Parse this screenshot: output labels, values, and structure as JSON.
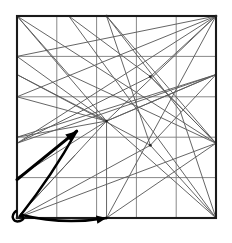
{
  "figure": {
    "background_color": "#ffffff",
    "caption": "",
    "width": 232,
    "height": 243
  },
  "colors": {
    "border": "#1a1a1a",
    "grid": "#7a7a7a",
    "ray": "#5d5d5d",
    "arrow": "#000000",
    "background": "#ffffff"
  },
  "chart_data": {
    "type": "line",
    "subtitle": "",
    "xlabel": "",
    "ylabel": "",
    "xlim": [
      0,
      5
    ],
    "ylim": [
      0,
      5
    ],
    "grid": true,
    "legend": null,
    "square": {
      "x0": 17,
      "y0": 16,
      "x1": 216,
      "y1": 218,
      "rows": 5,
      "cols": 5
    },
    "grid_lines": {
      "vertical_x": [
        1,
        2,
        3,
        4
      ],
      "horizontal_y": [
        1,
        2,
        3,
        4
      ]
    },
    "series": [
      {
        "name": "ray-1",
        "points": [
          [
            0,
            5
          ],
          [
            5,
            1.85
          ]
        ]
      },
      {
        "name": "ray-2",
        "points": [
          [
            0,
            5
          ],
          [
            2.25,
            2.4
          ]
        ]
      },
      {
        "name": "ray-3",
        "points": [
          [
            0,
            5
          ],
          [
            1.3,
            3.55
          ]
        ]
      },
      {
        "name": "ray-4",
        "points": [
          [
            0,
            4
          ],
          [
            2.25,
            2.4
          ]
        ]
      },
      {
        "name": "ray-5",
        "points": [
          [
            0,
            4
          ],
          [
            5,
            5
          ]
        ]
      },
      {
        "name": "ray-6",
        "points": [
          [
            0,
            3
          ],
          [
            2.25,
            2.4
          ]
        ]
      },
      {
        "name": "ray-7",
        "points": [
          [
            0,
            3
          ],
          [
            5,
            5
          ]
        ]
      },
      {
        "name": "ray-8",
        "points": [
          [
            0,
            2
          ],
          [
            2.25,
            2.4
          ]
        ]
      },
      {
        "name": "ray-9",
        "points": [
          [
            0,
            2
          ],
          [
            5,
            3.55
          ]
        ]
      },
      {
        "name": "ray-10",
        "points": [
          [
            0,
            1
          ],
          [
            2.25,
            2.4
          ]
        ]
      },
      {
        "name": "ray-11",
        "points": [
          [
            0,
            0
          ],
          [
            2.25,
            2.4
          ]
        ]
      },
      {
        "name": "ray-12",
        "points": [
          [
            0,
            0
          ],
          [
            5,
            1.85
          ]
        ]
      },
      {
        "name": "ray-13",
        "points": [
          [
            2.25,
            2.4
          ],
          [
            5,
            5
          ]
        ]
      },
      {
        "name": "ray-14",
        "points": [
          [
            2.25,
            2.4
          ],
          [
            5,
            3.55
          ]
        ]
      },
      {
        "name": "ray-15",
        "points": [
          [
            2.25,
            2.4
          ],
          [
            5,
            0
          ]
        ]
      },
      {
        "name": "ray-16",
        "points": [
          [
            2.25,
            2.4
          ],
          [
            2.25,
            0
          ]
        ]
      },
      {
        "name": "ray-17",
        "points": [
          [
            1.3,
            5
          ],
          [
            5,
            0
          ]
        ]
      },
      {
        "name": "ray-18",
        "points": [
          [
            1.3,
            5
          ],
          [
            3.35,
            3.5
          ]
        ]
      },
      {
        "name": "ray-19",
        "points": [
          [
            3.35,
            3.5
          ],
          [
            5,
            5
          ]
        ]
      },
      {
        "name": "ray-20",
        "points": [
          [
            3.35,
            3.5
          ],
          [
            0,
            1.85
          ]
        ]
      },
      {
        "name": "ray-21",
        "points": [
          [
            5,
            5
          ],
          [
            0,
            1.85
          ]
        ]
      },
      {
        "name": "ray-22",
        "points": [
          [
            5,
            5
          ],
          [
            2.25,
            0
          ]
        ]
      },
      {
        "name": "ray-23",
        "points": [
          [
            5,
            3.55
          ],
          [
            0,
            1.85
          ]
        ]
      },
      {
        "name": "ray-24",
        "points": [
          [
            5,
            3.55
          ],
          [
            2.25,
            2.4
          ]
        ]
      },
      {
        "name": "ray-25",
        "points": [
          [
            5,
            1.85
          ],
          [
            2.25,
            0
          ]
        ]
      },
      {
        "name": "ray-26",
        "points": [
          [
            5,
            1.85
          ],
          [
            3.35,
            3.5
          ]
        ]
      },
      {
        "name": "ray-27",
        "points": [
          [
            3.35,
            1.8
          ],
          [
            5,
            3.55
          ]
        ]
      },
      {
        "name": "ray-28",
        "points": [
          [
            3.35,
            1.8
          ],
          [
            0,
            0
          ]
        ]
      },
      {
        "name": "ray-29",
        "points": [
          [
            3.35,
            1.8
          ],
          [
            5,
            0
          ]
        ]
      },
      {
        "name": "ray-30",
        "points": [
          [
            3.35,
            1.8
          ],
          [
            2.25,
            5
          ]
        ]
      },
      {
        "name": "ray-31",
        "points": [
          [
            3.35,
            1.8
          ],
          [
            0,
            3.55
          ]
        ]
      },
      {
        "name": "ray-32",
        "points": [
          [
            4.1,
            2.65
          ],
          [
            2.25,
            5
          ]
        ]
      },
      {
        "name": "ray-33",
        "points": [
          [
            4.1,
            2.65
          ],
          [
            5,
            0
          ]
        ]
      },
      {
        "name": "ray-34",
        "points": [
          [
            2.25,
            5
          ],
          [
            5,
            1.85
          ]
        ]
      },
      {
        "name": "ray-35",
        "points": [
          [
            0,
            0
          ],
          [
            1.45,
            1.55
          ]
        ]
      },
      {
        "name": "ray-36",
        "points": [
          [
            3.35,
            3.5
          ],
          [
            5,
            1.85
          ]
        ]
      },
      {
        "name": "ray-37",
        "points": [
          [
            1.3,
            3.55
          ],
          [
            5,
            1.85
          ]
        ]
      },
      {
        "name": "ray-38",
        "points": [
          [
            2.25,
            2.4
          ],
          [
            0,
            3.55
          ]
        ]
      }
    ],
    "vertices": [
      {
        "name": "hub-center-left",
        "x": 2.25,
        "y": 2.4
      },
      {
        "name": "hub-upper-right",
        "x": 3.35,
        "y": 3.5
      },
      {
        "name": "hub-lower-right",
        "x": 3.35,
        "y": 1.8
      },
      {
        "name": "edge-top-mid",
        "x": 2.25,
        "y": 5
      },
      {
        "name": "edge-bottom-mid",
        "x": 2.25,
        "y": 0
      },
      {
        "name": "corner-top-right",
        "x": 5,
        "y": 5
      },
      {
        "name": "corner-bottom-left",
        "x": 0,
        "y": 0
      }
    ],
    "annotations": [
      {
        "name": "direction-arrow",
        "kind": "arrow",
        "from": [
          0,
          0.95
        ],
        "to": [
          1.5,
          2.15
        ],
        "label": ""
      },
      {
        "name": "angle-arc",
        "kind": "arc",
        "from": [
          0.1,
          0.08
        ],
        "to": [
          2.25,
          0
        ],
        "bulge": "outward",
        "label": ""
      },
      {
        "name": "angle-arc-secondary",
        "kind": "arc",
        "from": [
          0.1,
          0.08
        ],
        "to": [
          1.5,
          2.15
        ],
        "bulge": "outward",
        "label": ""
      },
      {
        "name": "corner-loop",
        "kind": "loop",
        "at": [
          0,
          0
        ],
        "label": ""
      }
    ]
  }
}
